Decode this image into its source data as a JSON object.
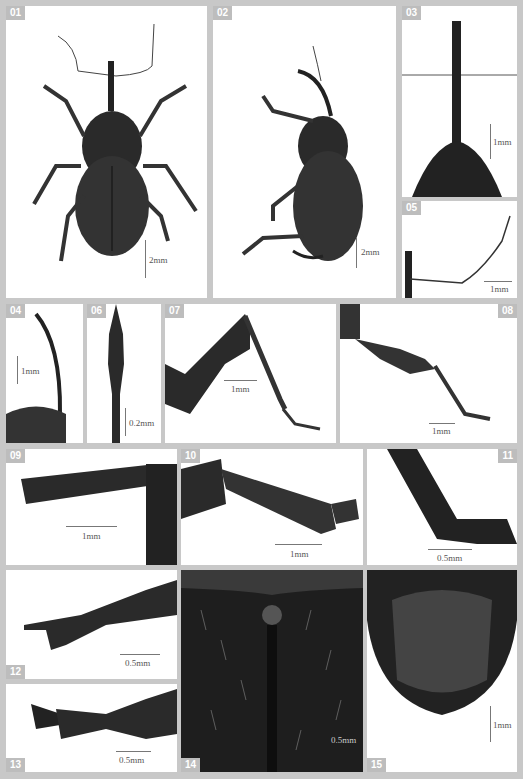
{
  "figure": {
    "panels": [
      {
        "id": "01",
        "scale": "2mm",
        "subject": "weevil-dorsal-habitus"
      },
      {
        "id": "02",
        "scale": "2mm",
        "subject": "weevil-lateral-habitus"
      },
      {
        "id": "03",
        "scale": "1mm",
        "subject": "rostrum-dorsal"
      },
      {
        "id": "04",
        "scale": "1mm",
        "subject": "rostrum-lateral"
      },
      {
        "id": "05",
        "scale": "1mm",
        "subject": "antenna"
      },
      {
        "id": "06",
        "scale": "0.2mm",
        "subject": "antennal-club"
      },
      {
        "id": "07",
        "scale": "1mm",
        "subject": "fore-leg"
      },
      {
        "id": "08",
        "scale": "1mm",
        "subject": "mid-leg"
      },
      {
        "id": "09",
        "scale": "1mm",
        "subject": "fore-tibia"
      },
      {
        "id": "10",
        "scale": "1mm",
        "subject": "mid-tibia"
      },
      {
        "id": "11",
        "scale": "0.5mm",
        "subject": "tibia-apex"
      },
      {
        "id": "12",
        "scale": "0.5mm",
        "subject": "tarsus-dorsal"
      },
      {
        "id": "13",
        "scale": "0.5mm",
        "subject": "tarsus-lateral"
      },
      {
        "id": "14",
        "scale": "0.5mm",
        "subject": "elytral-scutellum-vestiture"
      },
      {
        "id": "15",
        "scale": "1mm",
        "subject": "abdomen-ventral"
      }
    ]
  }
}
